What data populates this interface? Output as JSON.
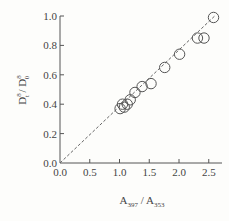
{
  "chart_data": {
    "type": "scatter",
    "title": "",
    "xlabel": "A397 / A353",
    "xlabel_parts": {
      "base1": "A",
      "sub1": "397",
      "sep": " / ",
      "base2": "A",
      "sub2": "353"
    },
    "ylabel": "D8t / D80",
    "ylabel_parts": {
      "base1": "D",
      "sup1": "8",
      "sub1": "t",
      "sep": " / ",
      "base2": "D",
      "sup2": "8",
      "sub2": "0"
    },
    "xlim": [
      0.0,
      2.7
    ],
    "ylim": [
      0.0,
      1.0
    ],
    "xticks": [
      "0.0",
      "0.5",
      "1.0",
      "1.5",
      "2.0",
      "2.5"
    ],
    "yticks": [
      "0.0",
      "0.2",
      "0.4",
      "0.6",
      "0.8",
      "1.0"
    ],
    "grid": false,
    "legend": null,
    "series": [
      {
        "name": "data",
        "marker": "open-circle",
        "x": [
          1.01,
          1.05,
          1.08,
          1.13,
          1.18,
          1.26,
          1.38,
          1.53,
          1.76,
          2.01,
          2.31,
          2.42,
          2.58
        ],
        "y": [
          0.37,
          0.4,
          0.38,
          0.4,
          0.43,
          0.48,
          0.52,
          0.54,
          0.65,
          0.74,
          0.85,
          0.85,
          0.99
        ]
      },
      {
        "name": "fit",
        "style": "dashed-line",
        "x": [
          0.0,
          2.6
        ],
        "y": [
          0.0,
          1.0
        ]
      }
    ]
  },
  "colors": {
    "axis": "#555555",
    "marker_stroke": "#555555",
    "fit_line": "#666666",
    "background": "#fdfdfb"
  }
}
